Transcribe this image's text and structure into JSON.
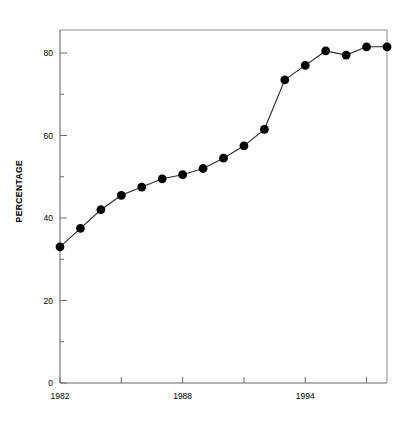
{
  "chart_data": {
    "type": "line",
    "title": "",
    "subtitle": "",
    "xlabel": "",
    "ylabel": "PERCENTAGE",
    "xlim": [
      1982,
      1998
    ],
    "ylim": [
      0,
      90
    ],
    "grid": false,
    "legend": null,
    "marker": "filled-circle",
    "x": [
      1982,
      1983,
      1984,
      1985,
      1986,
      1987,
      1988,
      1989,
      1990,
      1991,
      1992,
      1993,
      1994,
      1995,
      1996,
      1997,
      1998
    ],
    "values": [
      33.0,
      37.5,
      42.0,
      45.5,
      47.5,
      49.5,
      50.5,
      52.0,
      54.5,
      57.5,
      61.5,
      73.5,
      77.0,
      80.5,
      79.5,
      81.5,
      81.5
    ],
    "series": [
      {
        "name": "Percentage",
        "values": [
          33.0,
          37.5,
          42.0,
          45.5,
          47.5,
          49.5,
          50.5,
          52.0,
          54.5,
          57.5,
          61.5,
          73.5,
          77.0,
          80.5,
          79.5,
          81.5,
          81.5
        ]
      }
    ],
    "y_ticks_major": [
      0,
      20,
      40,
      60,
      80
    ],
    "y_ticks_minor": [
      10,
      30,
      50,
      70,
      90
    ],
    "y_tick_labels": [
      "0",
      "20",
      "40",
      "60",
      "80"
    ],
    "x_ticks_major": [
      1982,
      1988,
      1994
    ],
    "x_tick_labels": [
      "1982",
      "1988",
      "1994"
    ],
    "x_ticks_minor": [
      1985,
      1991,
      1997
    ],
    "colors": {
      "line": "#2b2b2b",
      "marker": "#000000",
      "axis": "#6b6b6b",
      "frame": "#8a8a8a",
      "background": "#ffffff",
      "text": "#000000"
    }
  },
  "axis_labels": {
    "y_0": "0",
    "y_20": "20",
    "y_40": "40",
    "y_60": "60",
    "y_80": "80",
    "x_1982": "1982",
    "x_1988": "1988",
    "x_1994": "1994"
  }
}
